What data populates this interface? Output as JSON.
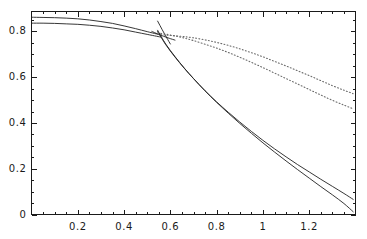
{
  "chart_data": {
    "type": "line",
    "title": "",
    "xlabel": "",
    "ylabel": "",
    "xlim": [
      0.0,
      1.4
    ],
    "ylim": [
      0.0,
      0.887
    ],
    "grid": false,
    "legend": null,
    "frame": true,
    "xticks": [
      0.2,
      0.4,
      0.6,
      0.8,
      1,
      1.2
    ],
    "xticklabels": [
      "0.2",
      "0.4",
      "0.6",
      "0.8",
      "1",
      "1.2"
    ],
    "yticks": [
      0,
      0.2,
      0.4,
      0.6,
      0.8
    ],
    "yticklabels": [
      "0",
      "0.2",
      "0.4",
      "0.6",
      "0.8"
    ],
    "series": [
      {
        "name": "upper-solid-branch",
        "style": "solid",
        "color": "#202020",
        "x": [
          0.0,
          0.05,
          0.1,
          0.15,
          0.2,
          0.25,
          0.3,
          0.35,
          0.4,
          0.45,
          0.5,
          0.54,
          0.56
        ],
        "y": [
          0.862,
          0.861,
          0.86,
          0.858,
          0.855,
          0.85,
          0.843,
          0.835,
          0.824,
          0.812,
          0.799,
          0.789,
          0.784
        ]
      },
      {
        "name": "lower-solid-branch",
        "style": "solid",
        "color": "#202020",
        "x": [
          0.0,
          0.05,
          0.1,
          0.15,
          0.2,
          0.25,
          0.3,
          0.35,
          0.4,
          0.45,
          0.5,
          0.54,
          0.56
        ],
        "y": [
          0.836,
          0.836,
          0.835,
          0.833,
          0.831,
          0.827,
          0.822,
          0.815,
          0.807,
          0.797,
          0.787,
          0.779,
          0.775
        ]
      },
      {
        "name": "steep-descending-curve-a",
        "style": "solid",
        "color": "#202020",
        "x": [
          0.545,
          0.58,
          0.62,
          0.66,
          0.7,
          0.75,
          0.8,
          0.85,
          0.9,
          0.95,
          1.0,
          1.05,
          1.1,
          1.15,
          1.2,
          1.25,
          1.3,
          1.35,
          1.39
        ],
        "y": [
          0.805,
          0.745,
          0.69,
          0.64,
          0.594,
          0.54,
          0.49,
          0.443,
          0.398,
          0.355,
          0.313,
          0.273,
          0.234,
          0.196,
          0.159,
          0.122,
          0.086,
          0.048,
          0.012
        ]
      },
      {
        "name": "steep-descending-curve-b",
        "style": "solid",
        "color": "#202020",
        "x": [
          0.545,
          0.58,
          0.62,
          0.66,
          0.7,
          0.75,
          0.8,
          0.85,
          0.9,
          0.95,
          1.0,
          1.05,
          1.1,
          1.15,
          1.2,
          1.25,
          1.3,
          1.35,
          1.39
        ],
        "y": [
          0.8,
          0.742,
          0.688,
          0.639,
          0.594,
          0.541,
          0.492,
          0.447,
          0.404,
          0.363,
          0.324,
          0.287,
          0.252,
          0.218,
          0.186,
          0.154,
          0.123,
          0.092,
          0.066
        ]
      },
      {
        "name": "short-steep-chord",
        "style": "solid",
        "color": "#202020",
        "x": [
          0.545,
          0.555,
          0.565,
          0.575,
          0.585,
          0.6
        ],
        "y": [
          0.845,
          0.826,
          0.807,
          0.789,
          0.771,
          0.745
        ]
      },
      {
        "name": "short-shallow-chord",
        "style": "solid",
        "color": "#202020",
        "x": [
          0.52,
          0.545,
          0.57,
          0.595,
          0.62
        ],
        "y": [
          0.8,
          0.789,
          0.779,
          0.77,
          0.762
        ]
      },
      {
        "name": "upper-dotted-branch",
        "style": "dotted",
        "color": "#6a6a6a",
        "x": [
          0.545,
          0.58,
          0.62,
          0.66,
          0.7,
          0.75,
          0.8,
          0.85,
          0.9,
          0.95,
          1.0,
          1.05,
          1.1,
          1.15,
          1.2,
          1.25,
          1.3,
          1.35,
          1.39
        ],
        "y": [
          0.793,
          0.788,
          0.78,
          0.771,
          0.76,
          0.744,
          0.727,
          0.708,
          0.687,
          0.665,
          0.642,
          0.618,
          0.594,
          0.57,
          0.546,
          0.522,
          0.499,
          0.478,
          0.462
        ]
      },
      {
        "name": "lower-dotted-branch",
        "style": "dotted",
        "color": "#6a6a6a",
        "x": [
          0.545,
          0.58,
          0.62,
          0.66,
          0.7,
          0.75,
          0.8,
          0.85,
          0.9,
          0.95,
          1.0,
          1.05,
          1.1,
          1.15,
          1.2,
          1.25,
          1.3,
          1.35,
          1.39
        ],
        "y": [
          0.787,
          0.784,
          0.781,
          0.777,
          0.772,
          0.763,
          0.752,
          0.739,
          0.724,
          0.707,
          0.689,
          0.669,
          0.649,
          0.628,
          0.607,
          0.585,
          0.563,
          0.543,
          0.528
        ]
      }
    ]
  },
  "axes": {
    "axis_color": "#1a1a1a",
    "tick_color": "#1a1a1a",
    "background": "#ffffff"
  }
}
